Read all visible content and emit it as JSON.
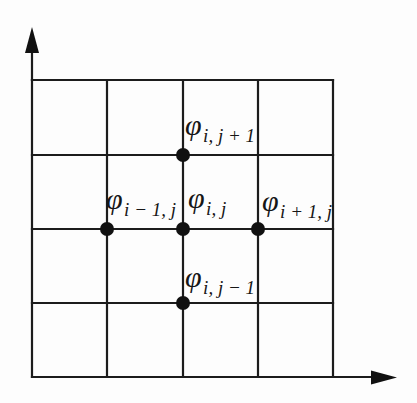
{
  "diagram": {
    "colors": {
      "line": "#1c1c1c",
      "dot": "#111111",
      "background": "#fdfdfd"
    },
    "nodes": {
      "top": {
        "base": "φ",
        "sub": "i, j + 1"
      },
      "left": {
        "base": "φ",
        "sub": "i − 1, j"
      },
      "center": {
        "base": "φ",
        "sub": "i, j"
      },
      "right": {
        "base": "φ",
        "sub": "i + 1, j"
      },
      "bottom": {
        "base": "φ",
        "sub": "i, j − 1"
      }
    }
  }
}
